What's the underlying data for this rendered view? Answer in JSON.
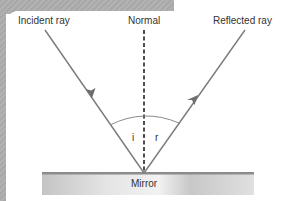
{
  "diagram": {
    "labels": {
      "incident": "Incident ray",
      "normal": "Normal",
      "reflected": "Reflected ray",
      "angle_i": "i",
      "angle_r": "r",
      "mirror": "Mirror"
    },
    "colors": {
      "ray": "#7a7a7a",
      "normal": "#222222",
      "arc": "#8a8a8a",
      "mirror_top": "#8c8c8c",
      "mirror_fill": "#d0d0d0",
      "background_grey": "#aeaeae"
    }
  }
}
